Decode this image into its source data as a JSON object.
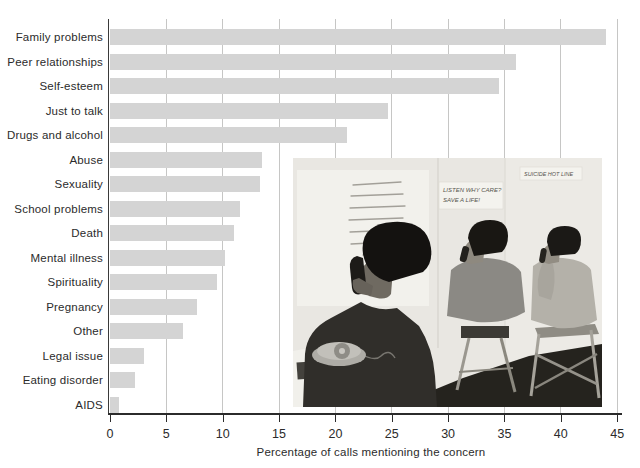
{
  "chart_data": {
    "type": "bar",
    "orientation": "horizontal",
    "xlabel": "Percentage of calls mentioning the concern",
    "xlim": [
      0,
      45
    ],
    "x_ticks": [
      0,
      5,
      10,
      15,
      20,
      25,
      30,
      35,
      40,
      45
    ],
    "grid": "vertical gridlines at every 5 units",
    "bar_color": "#d4d4d4",
    "categories": [
      "Family problems",
      "Peer relationships",
      "Self-esteem",
      "Just to talk",
      "Drugs and alcohol",
      "Abuse",
      "Sexuality",
      "School problems",
      "Death",
      "Mental illness",
      "Spirituality",
      "Pregnancy",
      "Other",
      "Legal issue",
      "Eating disorder",
      "AIDS"
    ],
    "values": [
      44,
      36,
      34.5,
      24.7,
      21,
      13.5,
      13.3,
      11.5,
      11,
      10.2,
      9.5,
      7.7,
      6.5,
      3,
      2.2,
      0.8
    ]
  },
  "photo": {
    "description": "Black-and-white photograph of three teenage volunteers answering telephones at a crisis hotline",
    "sign_listen_line1": "LISTEN  WHY CARE?",
    "sign_listen_line2": "SAVE A LIFE!",
    "sign_hotline": "SUICIDE HOT LINE"
  }
}
